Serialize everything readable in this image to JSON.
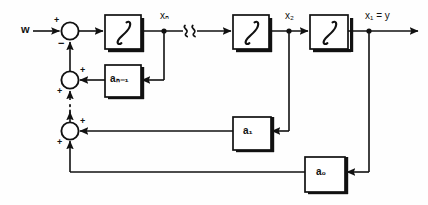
{
  "diagram": {
    "colors": {
      "line": "#111111",
      "block_fill": "#ffffff",
      "block_stroke": "#111111",
      "shadow": "#111111",
      "background": "#fefefe"
    },
    "input": {
      "label": "w",
      "name": "reference-input"
    },
    "output": {
      "label": "x₁ = y",
      "name": "system-output"
    },
    "node_labels": {
      "xn": "xₙ",
      "x2": "x₂",
      "x1y": "x₁ = y"
    },
    "break_mark": {
      "symbol": "ⱃⱃ",
      "name": "line-break-squiggle",
      "meaning": "omitted repeated integrator stages"
    },
    "ellipsis": {
      "symbol": "⋮",
      "meaning": "omitted repeated feedback summing junctions"
    },
    "integrators": [
      {
        "id": "int-n",
        "symbol": "∫",
        "output_label": "xₙ"
      },
      {
        "id": "int-2",
        "symbol": "∫",
        "output_label": "x₂"
      },
      {
        "id": "int-1",
        "symbol": "∫",
        "output_label": "x₁ = y"
      }
    ],
    "gain_blocks": [
      {
        "id": "gain-an1",
        "base": "a",
        "sub": "n-1",
        "label": "aₙ₋₁",
        "feeds_from": "xₙ"
      },
      {
        "id": "gain-a1",
        "base": "a",
        "sub": "1",
        "label": "a₁",
        "feeds_from": "x₂"
      },
      {
        "id": "gain-a0",
        "base": "a",
        "sub": "0",
        "label": "a₀",
        "feeds_from": "x₁ = y"
      }
    ],
    "summing_junctions": [
      {
        "id": "sum-1",
        "name": "input-summing-junction",
        "signs": [
          {
            "symbol": "+",
            "port": "left",
            "source": "w"
          },
          {
            "symbol": "−",
            "port": "bottom",
            "source": "feedback"
          }
        ]
      },
      {
        "id": "sum-2",
        "name": "feedback-summing-junction-upper",
        "signs": [
          {
            "symbol": "+",
            "port": "right",
            "source": "aₙ₋₁"
          },
          {
            "symbol": "+",
            "port": "bottom",
            "source": "lower stages"
          }
        ]
      },
      {
        "id": "sum-3",
        "name": "feedback-summing-junction-lower",
        "signs": [
          {
            "symbol": "+",
            "port": "right",
            "source": "a₁"
          },
          {
            "symbol": "+",
            "port": "bottom",
            "source": "a₀"
          }
        ]
      }
    ]
  }
}
